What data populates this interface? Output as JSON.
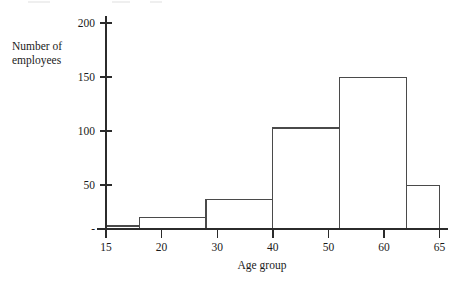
{
  "chart_data": {
    "type": "bar",
    "title": "",
    "subtitle": "",
    "xlabel": "Age group",
    "ylabel": "Number of employees",
    "ylabel_lines": [
      "Number of",
      "employees"
    ],
    "categories": [
      "15-20",
      "20-30",
      "30-40",
      "40-50",
      "50-60",
      "60-65"
    ],
    "bin_edges": [
      15,
      20,
      30,
      40,
      50,
      60,
      65
    ],
    "values": [
      3,
      11,
      29,
      98,
      147,
      42
    ],
    "xlim": [
      15,
      65
    ],
    "ylim": [
      0,
      215
    ],
    "x_tick_labels": [
      "15",
      "20",
      "30",
      "40",
      "50",
      "60",
      "65"
    ],
    "x_tick_values": [
      15,
      20,
      30,
      40,
      50,
      60,
      65
    ],
    "y_tick_labels": [
      "-",
      "50",
      "100",
      "150",
      "200"
    ],
    "y_tick_values": [
      0,
      50,
      100,
      150,
      200
    ],
    "grid": false,
    "legend": null,
    "legend_position": "none",
    "bar_fill_color": "#ffffff",
    "bar_edge_color": "#4a4a4a",
    "axis_color": "#2b2b2b",
    "background_color": "#ffffff",
    "annotations": []
  }
}
